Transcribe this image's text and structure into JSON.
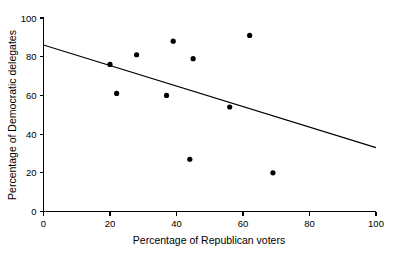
{
  "chart_data": {
    "type": "scatter",
    "title": "",
    "xlabel": "Percentage of Republican voters",
    "ylabel": "Percentage of Democratic delegates",
    "xlim": [
      0,
      100
    ],
    "ylim": [
      0,
      100
    ],
    "xticks": [
      "0",
      "20",
      "40",
      "60",
      "80",
      "100"
    ],
    "xtick_values": [
      0,
      20,
      40,
      60,
      80,
      100
    ],
    "yticks": [
      "0",
      "20",
      "40",
      "60",
      "80",
      "100"
    ],
    "ytick_values": [
      0,
      20,
      40,
      60,
      80,
      100
    ],
    "grid": false,
    "legend": "none",
    "marker": "filled-circle",
    "marker_color": "#000000",
    "line_color": "#000000",
    "axis_color": "#000000",
    "background_color": "#ffffff",
    "points": [
      {
        "x": 20,
        "y": 76
      },
      {
        "x": 22,
        "y": 61
      },
      {
        "x": 28,
        "y": 81
      },
      {
        "x": 37,
        "y": 60
      },
      {
        "x": 39,
        "y": 88
      },
      {
        "x": 44,
        "y": 27
      },
      {
        "x": 45,
        "y": 79
      },
      {
        "x": 56,
        "y": 54
      },
      {
        "x": 62,
        "y": 91
      },
      {
        "x": 69,
        "y": 20
      }
    ],
    "series": [
      {
        "name": "states",
        "x": [
          20,
          22,
          28,
          37,
          39,
          44,
          45,
          56,
          62,
          69
        ],
        "values": [
          76,
          61,
          81,
          60,
          88,
          27,
          79,
          54,
          91,
          20
        ]
      }
    ],
    "trend_line": {
      "type": "linear-fit",
      "x": [
        0,
        100
      ],
      "y": [
        86,
        33
      ],
      "intercept": 86,
      "slope": -0.53
    }
  }
}
